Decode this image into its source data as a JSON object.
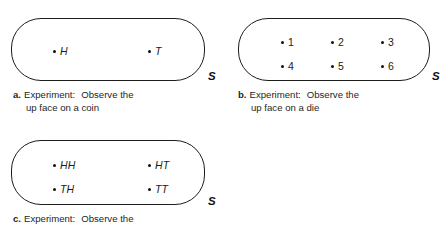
{
  "figure": {
    "space_letter": "S",
    "panels": [
      {
        "id": "a",
        "tag": "a.",
        "caption_line1_a": "Experiment:",
        "caption_line1_b": "Observe the",
        "caption_line2": "up face on a coin",
        "outcomes": [
          {
            "label": "H",
            "style": "italic"
          },
          {
            "label": "T",
            "style": "italic"
          }
        ]
      },
      {
        "id": "b",
        "tag": "b.",
        "caption_line1_a": "Experiment:",
        "caption_line1_b": "Observe the",
        "caption_line2": "up face on a die",
        "outcomes": [
          {
            "label": "1",
            "style": "roman"
          },
          {
            "label": "2",
            "style": "roman"
          },
          {
            "label": "3",
            "style": "roman"
          },
          {
            "label": "4",
            "style": "roman"
          },
          {
            "label": "5",
            "style": "roman"
          },
          {
            "label": "6",
            "style": "roman"
          }
        ]
      },
      {
        "id": "c",
        "tag": "c.",
        "caption_line1_a": "Experiment:",
        "caption_line1_b": "Observe the",
        "caption_line2": "",
        "outcomes": [
          {
            "label": "HH",
            "style": "italic"
          },
          {
            "label": "HT",
            "style": "italic"
          },
          {
            "label": "TH",
            "style": "italic"
          },
          {
            "label": "TT",
            "style": "italic"
          }
        ]
      }
    ]
  }
}
